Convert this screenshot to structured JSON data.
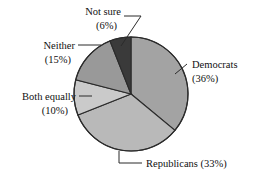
{
  "chart_data": {
    "type": "pie",
    "title": "",
    "categories": [
      "Democrats",
      "Republicans",
      "Both equally",
      "Neither",
      "Not sure"
    ],
    "values": [
      36,
      33,
      10,
      15,
      6
    ],
    "unit": "%",
    "start_angle_deg": 0,
    "direction": "clockwise",
    "legend": "none",
    "labels_position": "external-with-leader-lines",
    "slices": [
      {
        "name": "Democrats",
        "value": 36,
        "label_line1": "Democrats",
        "label_line2": "(36%)",
        "color": "#a3a3a3"
      },
      {
        "name": "Republicans",
        "value": 33,
        "label_line1": "Republicans (33%)",
        "label_line2": "",
        "color": "#b9b9b9"
      },
      {
        "name": "Both equally",
        "value": 10,
        "label_line1": "Both equally",
        "label_line2": "(10%)",
        "color": "#cacaca"
      },
      {
        "name": "Neither",
        "value": 15,
        "label_line1": "Neither",
        "label_line2": "(15%)",
        "color": "#999999"
      },
      {
        "name": "Not sure",
        "value": 6,
        "label_line1": "Not sure",
        "label_line2": "(6%)",
        "color": "#3a3a3a"
      }
    ]
  },
  "colors": {
    "background": "#ffffff",
    "outline": "#2b2b2b",
    "text": "#111111",
    "leader_line": "#2b2b2b"
  }
}
